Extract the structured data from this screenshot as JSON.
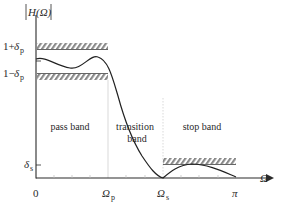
{
  "y_axis": {
    "label": "|H(Ω)|",
    "label_symbol": "H",
    "label_arg": "(Ω)",
    "ticks": [
      {
        "id": "upper",
        "base": "1+",
        "delta": "δ",
        "sub": "p"
      },
      {
        "id": "lower",
        "base": "1−",
        "delta": "δ",
        "sub": "p"
      },
      {
        "id": "stop",
        "base": "",
        "delta": "δ",
        "sub": "s"
      }
    ]
  },
  "x_axis": {
    "label": "Ω",
    "ticks": [
      {
        "id": "zero",
        "text": "0",
        "sub": ""
      },
      {
        "id": "omega_p",
        "text": "Ω",
        "sub": "p"
      },
      {
        "id": "omega_s",
        "text": "Ω",
        "sub": "s"
      },
      {
        "id": "pi",
        "text": "π",
        "sub": ""
      }
    ]
  },
  "regions": {
    "pass_band": "pass band",
    "transition_line1": "transition",
    "transition_line2": "band",
    "stop_band": "stop band"
  },
  "colors": {
    "axis": "#2a2a2a",
    "curve": "#222222",
    "hatch": "#8a8a8a",
    "guide": "#cfcfcf"
  }
}
